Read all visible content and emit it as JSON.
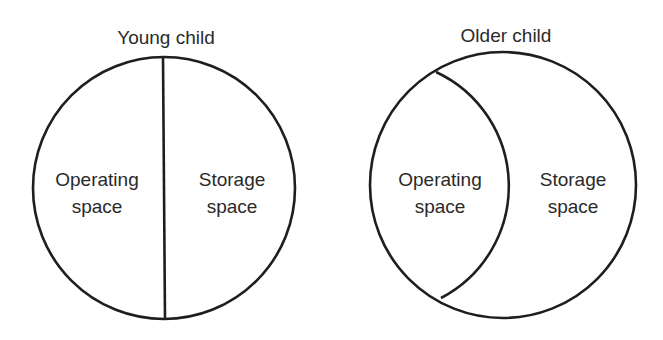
{
  "diagram": {
    "panels": [
      {
        "title": "Young child",
        "regions": [
          {
            "line1": "Operating",
            "line2": "space"
          },
          {
            "line1": "Storage",
            "line2": "space"
          }
        ],
        "divider": "straight-vertical"
      },
      {
        "title": "Older child",
        "regions": [
          {
            "line1": "Operating",
            "line2": "space"
          },
          {
            "line1": "Storage",
            "line2": "space"
          }
        ],
        "divider": "curved-arc"
      }
    ],
    "colors": {
      "stroke": "#1e1e1e",
      "text": "#2a2a2a",
      "background": "#ffffff"
    }
  }
}
